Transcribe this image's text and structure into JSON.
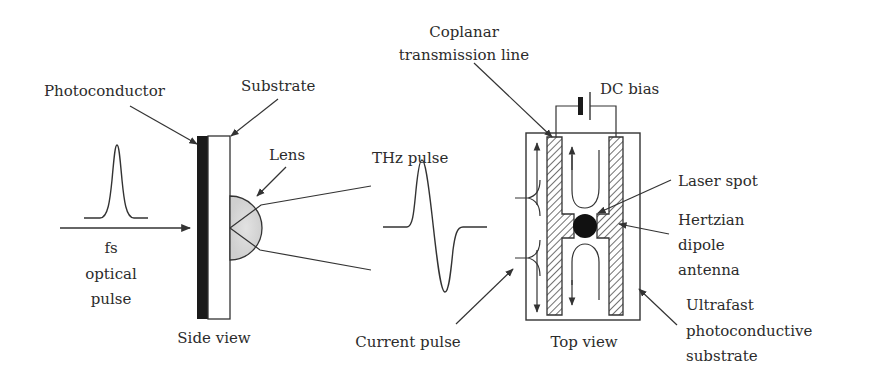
{
  "diagram": {
    "colors": {
      "ink": "#333333",
      "photoconductor": "#1a1a1a",
      "lens_fill": "#d8d8d8",
      "background": "#ffffff"
    },
    "side_view": {
      "caption": "Side view",
      "labels": {
        "photoconductor": "Photoconductor",
        "substrate": "Substrate",
        "lens": "Lens",
        "optical_line1": "fs",
        "optical_line2": "optical",
        "optical_line3": "pulse"
      }
    },
    "thz": {
      "label": "THz pulse"
    },
    "top_view": {
      "caption": "Top view",
      "labels": {
        "coplanar_line1": "Coplanar",
        "coplanar_line2": "transmission line",
        "dc_bias": "DC bias",
        "laser_spot": "Laser spot",
        "hertzian_line1": "Hertzian",
        "hertzian_line2": "dipole",
        "hertzian_line3": "antenna",
        "substrate_line1": "Ultrafast",
        "substrate_line2": "photoconductive",
        "substrate_line3": "substrate",
        "current_pulse": "Current pulse"
      }
    }
  }
}
